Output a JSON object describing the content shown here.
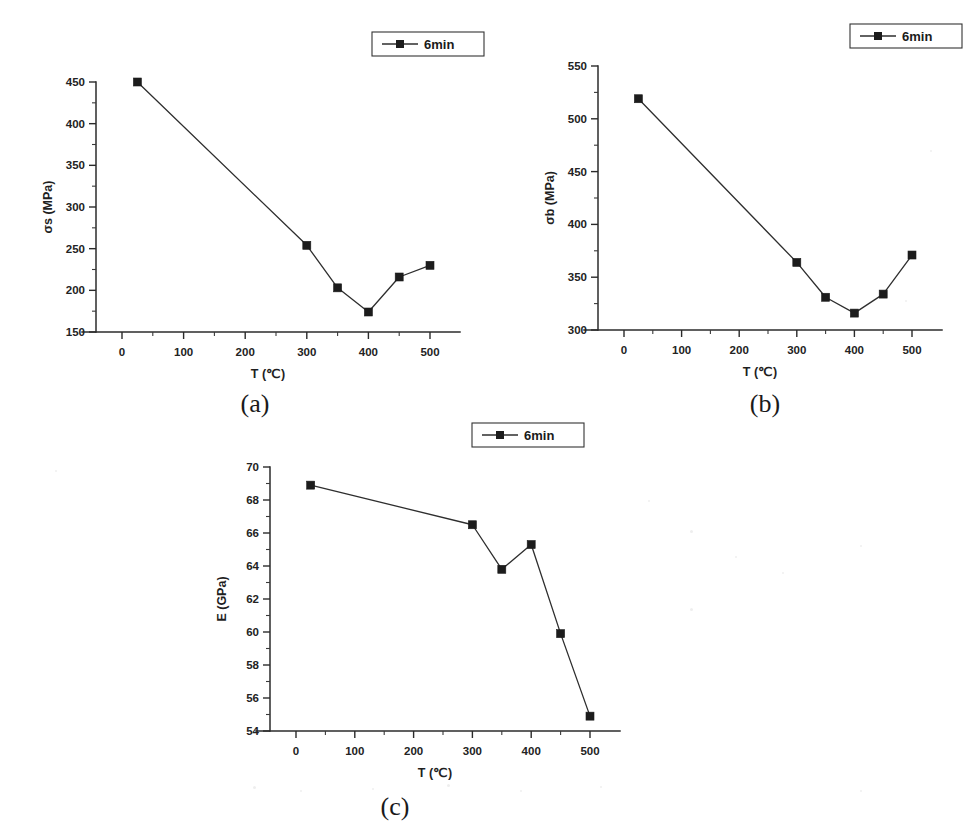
{
  "figure": {
    "background_color": "#ffffff",
    "ink_color": "#2b2b2b",
    "marker_color": "#1c1c1c"
  },
  "shared": {
    "x_axis_title": "T (℃)",
    "x_tick_labels": [
      "0",
      "100",
      "200",
      "300",
      "400",
      "500"
    ],
    "x_tick_values": [
      0,
      100,
      200,
      300,
      400,
      500
    ],
    "legend_label": "6min",
    "marker_shape": "filled-square"
  },
  "panels": [
    {
      "id": "a",
      "caption": "(a)",
      "y_axis_title": "σs (MPa)",
      "y_tick_labels": [
        "150",
        "200",
        "250",
        "300",
        "350",
        "400",
        "450"
      ],
      "legend_label": "6min"
    },
    {
      "id": "b",
      "caption": "(b)",
      "y_axis_title": "σb (MPa)",
      "y_tick_labels": [
        "300",
        "350",
        "400",
        "450",
        "500",
        "550"
      ],
      "legend_label": "6min"
    },
    {
      "id": "c",
      "caption": "(c)",
      "y_axis_title": "E (GPa)",
      "y_tick_labels": [
        "54",
        "56",
        "58",
        "60",
        "62",
        "64",
        "66",
        "68",
        "70"
      ],
      "legend_label": "6min"
    }
  ],
  "chart_data": [
    {
      "type": "line",
      "panel": "a",
      "title": "(a)",
      "xlabel": "T (℃)",
      "ylabel": "σs (MPa)",
      "xlim": [
        0,
        500
      ],
      "ylim": [
        150,
        450
      ],
      "x_ticks": [
        0,
        100,
        200,
        300,
        400,
        500
      ],
      "y_ticks": [
        150,
        200,
        250,
        300,
        350,
        400,
        450
      ],
      "grid": false,
      "legend_position": "top-right-outside",
      "series": [
        {
          "name": "6min",
          "marker": "filled-square",
          "x": [
            25,
            300,
            350,
            400,
            450,
            500
          ],
          "values": [
            450,
            254,
            203,
            174,
            216,
            230
          ]
        }
      ]
    },
    {
      "type": "line",
      "panel": "b",
      "title": "(b)",
      "xlabel": "T (℃)",
      "ylabel": "σb (MPa)",
      "xlim": [
        0,
        500
      ],
      "ylim": [
        300,
        550
      ],
      "x_ticks": [
        0,
        100,
        200,
        300,
        400,
        500
      ],
      "y_ticks": [
        300,
        350,
        400,
        450,
        500,
        550
      ],
      "grid": false,
      "legend_position": "top-right-outside",
      "series": [
        {
          "name": "6min",
          "marker": "filled-square",
          "x": [
            25,
            300,
            350,
            400,
            450,
            500
          ],
          "values": [
            519,
            364,
            331,
            316,
            334,
            371
          ]
        }
      ]
    },
    {
      "type": "line",
      "panel": "c",
      "title": "(c)",
      "xlabel": "T (℃)",
      "ylabel": "E (GPa)",
      "xlim": [
        0,
        500
      ],
      "ylim": [
        54,
        70
      ],
      "x_ticks": [
        0,
        100,
        200,
        300,
        400,
        500
      ],
      "y_ticks": [
        54,
        56,
        58,
        60,
        62,
        64,
        66,
        68,
        70
      ],
      "grid": false,
      "legend_position": "top-right-outside",
      "series": [
        {
          "name": "6min",
          "marker": "filled-square",
          "x": [
            25,
            300,
            350,
            400,
            450,
            500
          ],
          "values": [
            68.9,
            66.5,
            63.8,
            65.3,
            59.9,
            54.9
          ]
        }
      ]
    }
  ]
}
